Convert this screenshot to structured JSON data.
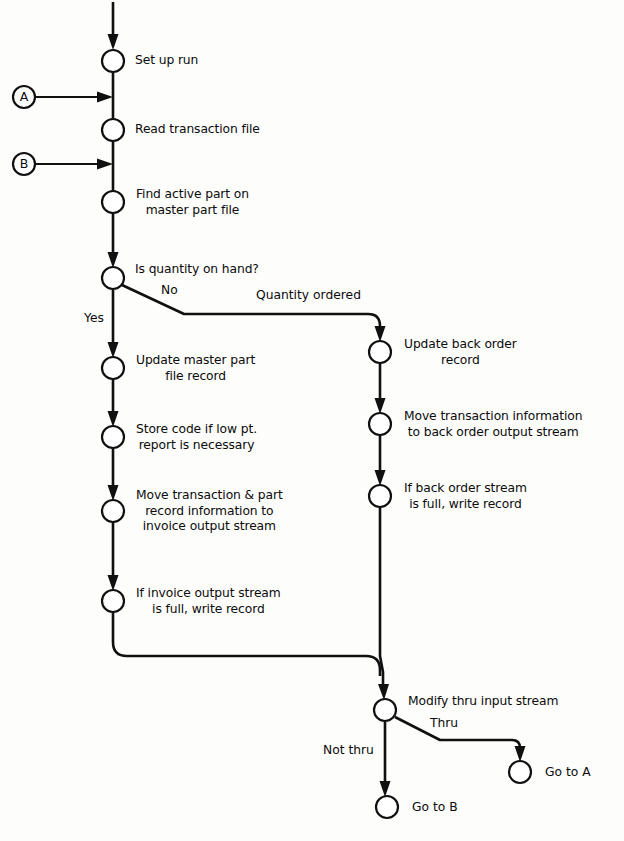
{
  "diagram": {
    "type": "flowchart",
    "background_color": "#fdfdfb",
    "line_color": "#101010",
    "node_fill_color": "#ffffff"
  },
  "connectors": {
    "entry_a": {
      "letter": "A",
      "cx": 24,
      "cy": 97
    },
    "entry_b": {
      "letter": "B",
      "cx": 24,
      "cy": 164
    }
  },
  "nodes": [
    {
      "id": "setup",
      "label": "Set up run",
      "cx": 113,
      "cy": 61,
      "lines": [
        "Set up run"
      ]
    },
    {
      "id": "read",
      "label": "Read transaction file",
      "cx": 113,
      "cy": 130,
      "lines": [
        "Read transaction file"
      ]
    },
    {
      "id": "find",
      "label": "Find active part on master part file",
      "cx": 113,
      "cy": 202,
      "lines": [
        "Find active part on",
        "master part file"
      ]
    },
    {
      "id": "decide_qty",
      "label": "Is quantity on hand?",
      "cx": 113,
      "cy": 278,
      "lines": [
        "Is quantity on hand?"
      ]
    },
    {
      "id": "update_mpf",
      "label": "Update master part file record",
      "cx": 113,
      "cy": 368,
      "lines": [
        "Update master part",
        "file record"
      ]
    },
    {
      "id": "store_code",
      "label": "Store code if low pt. report is necessary",
      "cx": 113,
      "cy": 437,
      "lines": [
        "Store code if low pt.",
        "report is necessary"
      ]
    },
    {
      "id": "move_inv",
      "label": "Move transaction & part record information to invoice output stream",
      "cx": 113,
      "cy": 511,
      "lines": [
        "Move transaction & part",
        "record information to",
        "invoice output stream"
      ]
    },
    {
      "id": "write_inv",
      "label": "If invoice output stream is full, write record",
      "cx": 113,
      "cy": 601,
      "lines": [
        "If invoice output stream",
        "is full, write record"
      ]
    },
    {
      "id": "update_bo",
      "label": "Update back order record",
      "cx": 380,
      "cy": 352,
      "lines": [
        "Update back order",
        "record"
      ]
    },
    {
      "id": "move_bo",
      "label": "Move transaction information to back order output stream",
      "cx": 380,
      "cy": 424,
      "lines": [
        "Move transaction information",
        "to back order output stream"
      ]
    },
    {
      "id": "write_bo",
      "label": "If back order stream is full, write record",
      "cx": 380,
      "cy": 496,
      "lines": [
        "If back order stream",
        "is full, write record"
      ]
    },
    {
      "id": "modify_thru",
      "label": "Modify thru input stream",
      "cx": 385,
      "cy": 710,
      "lines": [
        "Modify thru input stream"
      ]
    },
    {
      "id": "goto_a",
      "label": "Go to A",
      "cx": 520,
      "cy": 772,
      "lines": [
        "Go to A"
      ]
    },
    {
      "id": "goto_b",
      "label": "Go to B",
      "cx": 387,
      "cy": 807,
      "lines": [
        "Go to B"
      ]
    }
  ],
  "edge_labels": [
    {
      "id": "label-yes",
      "text": "Yes",
      "x": 84,
      "y": 318
    },
    {
      "id": "label-no",
      "text": "No",
      "x": 161,
      "y": 289
    },
    {
      "id": "label-quantity-ordered",
      "text": "Quantity ordered",
      "x": 256,
      "y": 294
    },
    {
      "id": "label-thru",
      "text": "Thru",
      "x": 430,
      "y": 722
    },
    {
      "id": "label-not-thru",
      "text": "Not thru",
      "x": 323,
      "y": 749
    }
  ],
  "node_labels": {
    "setup": {
      "x": 135,
      "y": 54,
      "align": "left"
    },
    "read": {
      "x": 135,
      "y": 123,
      "align": "left"
    },
    "find": {
      "x": 136,
      "y": 188,
      "align": "center"
    },
    "decide_qty": {
      "x": 135,
      "y": 263,
      "align": "left"
    },
    "update_mpf": {
      "x": 136,
      "y": 354,
      "align": "center"
    },
    "store_code": {
      "x": 136,
      "y": 423,
      "align": "center"
    },
    "move_inv": {
      "x": 136,
      "y": 489,
      "align": "center"
    },
    "write_inv": {
      "x": 136,
      "y": 587,
      "align": "center"
    },
    "update_bo": {
      "x": 404,
      "y": 338,
      "align": "center"
    },
    "move_bo": {
      "x": 404,
      "y": 410,
      "align": "center"
    },
    "write_bo": {
      "x": 404,
      "y": 482,
      "align": "center"
    },
    "modify_thru": {
      "x": 408,
      "y": 695,
      "align": "left"
    },
    "goto_a": {
      "x": 545,
      "y": 765,
      "align": "left"
    },
    "goto_b": {
      "x": 412,
      "y": 800,
      "align": "left"
    }
  },
  "caption": {
    "text": "",
    "y": 832
  }
}
